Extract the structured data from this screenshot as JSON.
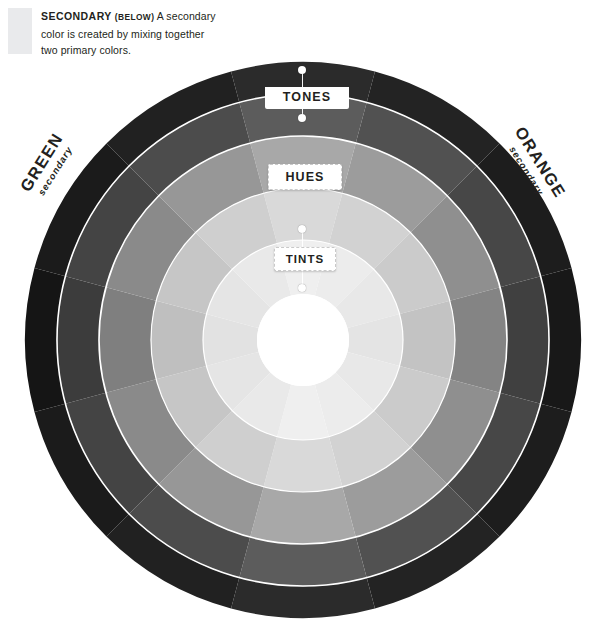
{
  "caption": {
    "lead": "SECONDARY",
    "qualifier": "(BELOW)",
    "body": " A secondary color is created by mixing together two primary colors."
  },
  "wheel": {
    "center": {
      "x": 303,
      "y": 340
    },
    "outer_radius": 278,
    "segments": 12,
    "ring_count": 5,
    "inner_white_radius": 46,
    "ring_boundaries_px": [
      46,
      100,
      152,
      204,
      246,
      278
    ],
    "separator_color": "#ffffff",
    "ring_names": [
      "tints-inner",
      "tints-outer",
      "hues",
      "tones-inner",
      "tones-outer"
    ],
    "ring_luminance": {
      "tints-inner": "lightest",
      "tints-outer": "light",
      "hues": "mid",
      "tones-inner": "dark",
      "tones-outer": "darkest"
    },
    "segment_colors": [
      {
        "index": 0,
        "angle_deg": 0,
        "rings": [
          "#efefef",
          "#d9d9d9",
          "#a8a8a8",
          "#5c5c5c",
          "#2b2b2b"
        ]
      },
      {
        "index": 1,
        "angle_deg": 30,
        "rings": [
          "#ececec",
          "#d2d2d2",
          "#9c9c9c",
          "#515151",
          "#232323"
        ]
      },
      {
        "index": 2,
        "angle_deg": 60,
        "rings": [
          "#e8e8e8",
          "#cbcbcb",
          "#8f8f8f",
          "#474747",
          "#1d1d1d"
        ]
      },
      {
        "index": 3,
        "angle_deg": 90,
        "rings": [
          "#e4e4e4",
          "#c3c3c3",
          "#848484",
          "#404040",
          "#181818"
        ]
      },
      {
        "index": 4,
        "angle_deg": 120,
        "rings": [
          "#e8e8e8",
          "#cbcbcb",
          "#8f8f8f",
          "#474747",
          "#1d1d1d"
        ]
      },
      {
        "index": 5,
        "angle_deg": 150,
        "rings": [
          "#ececec",
          "#d2d2d2",
          "#9c9c9c",
          "#515151",
          "#232323"
        ]
      },
      {
        "index": 6,
        "angle_deg": 180,
        "rings": [
          "#efefef",
          "#d9d9d9",
          "#a8a8a8",
          "#5c5c5c",
          "#2b2b2b"
        ]
      },
      {
        "index": 7,
        "angle_deg": 210,
        "rings": [
          "#e9e9e9",
          "#cfcfcf",
          "#979797",
          "#4c4c4c",
          "#212121"
        ]
      },
      {
        "index": 8,
        "angle_deg": 240,
        "rings": [
          "#e5e5e5",
          "#c6c6c6",
          "#8a8a8a",
          "#444444",
          "#1b1b1b"
        ]
      },
      {
        "index": 9,
        "angle_deg": 270,
        "rings": [
          "#e2e2e2",
          "#bfbfbf",
          "#7f7f7f",
          "#3c3c3c",
          "#151515"
        ]
      },
      {
        "index": 10,
        "angle_deg": 300,
        "rings": [
          "#e5e5e5",
          "#c6c6c6",
          "#8a8a8a",
          "#444444",
          "#1b1b1b"
        ]
      },
      {
        "index": 11,
        "angle_deg": 330,
        "rings": [
          "#e9e9e9",
          "#cfcfcf",
          "#979797",
          "#4c4c4c",
          "#212121"
        ]
      }
    ]
  },
  "banners": {
    "tones": "TONES",
    "hues": "HUES",
    "tints": "TINTS"
  },
  "side_labels": {
    "left": {
      "name": "GREEN",
      "role": "secondary"
    },
    "right": {
      "name": "ORANGE",
      "role": "secondary"
    }
  },
  "colors": {
    "page_background": "#ffffff",
    "text": "#231f20",
    "swatch": "#e9eaec",
    "banner_background": "#ffffff"
  }
}
